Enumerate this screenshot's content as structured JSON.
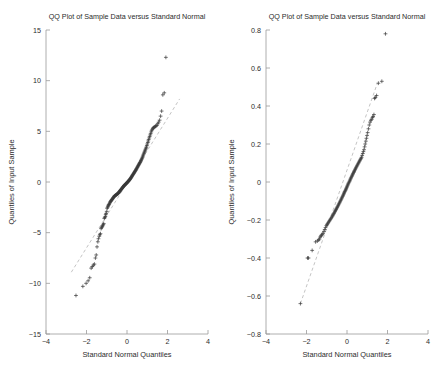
{
  "figure": {
    "width": 440,
    "height": 379,
    "background": "#ffffff",
    "marker_color": "#3a3a3a",
    "axis_color": "#9a9a9a",
    "refline_color": "#b9b9b9",
    "marker_symbol": "+"
  },
  "chart_data": [
    {
      "type": "scatter",
      "panel": "left",
      "title": "QQ Plot of Sample Data versus Standard Normal",
      "xlabel": "Standard Normal Quantiles",
      "ylabel": "Quantiles of Input Sample",
      "xlim": [
        -4,
        4
      ],
      "ylim": [
        -15,
        15
      ],
      "xticks": [
        -4,
        -2,
        0,
        2,
        4
      ],
      "xticklabels": [
        "-4",
        "-2",
        "0",
        "2",
        "4"
      ],
      "yticks": [
        15,
        10,
        5,
        0,
        -5,
        -10,
        -15
      ],
      "yticklabels": [
        "15",
        "10",
        "5",
        "0",
        "-5",
        "-10",
        "-15"
      ],
      "grid": false,
      "legend": "none",
      "reference_line": {
        "x": [
          -2.75,
          2.6
        ],
        "y": [
          -8.9,
          8.2
        ],
        "style": "dashed"
      },
      "x": [
        -2.52,
        -2.18,
        -2.02,
        -1.92,
        -1.84,
        -1.77,
        -1.71,
        -1.66,
        -1.61,
        -1.56,
        -1.52,
        -1.48,
        -1.44,
        -1.41,
        -1.37,
        -1.34,
        -1.31,
        -1.28,
        -1.25,
        -1.22,
        -1.2,
        -1.17,
        -1.15,
        -1.12,
        -1.1,
        -1.07,
        -1.05,
        -1.03,
        -1.0,
        -0.98,
        -0.96,
        -0.94,
        -0.92,
        -0.9,
        -0.88,
        -0.86,
        -0.84,
        -0.82,
        -0.8,
        -0.78,
        -0.77,
        -0.75,
        -0.73,
        -0.71,
        -0.69,
        -0.68,
        -0.66,
        -0.64,
        -0.62,
        -0.61,
        -0.59,
        -0.57,
        -0.56,
        -0.54,
        -0.52,
        -0.51,
        -0.49,
        -0.47,
        -0.46,
        -0.44,
        -0.43,
        -0.41,
        -0.39,
        -0.38,
        -0.36,
        -0.35,
        -0.33,
        -0.32,
        -0.3,
        -0.28,
        -0.27,
        -0.25,
        -0.24,
        -0.22,
        -0.21,
        -0.19,
        -0.18,
        -0.16,
        -0.15,
        -0.13,
        -0.12,
        -0.1,
        -0.09,
        -0.07,
        -0.06,
        -0.04,
        -0.03,
        -0.01,
        0.0,
        0.01,
        0.03,
        0.04,
        0.06,
        0.07,
        0.09,
        0.1,
        0.12,
        0.13,
        0.15,
        0.16,
        0.18,
        0.19,
        0.21,
        0.22,
        0.24,
        0.25,
        0.27,
        0.28,
        0.3,
        0.32,
        0.33,
        0.35,
        0.36,
        0.38,
        0.39,
        0.41,
        0.43,
        0.44,
        0.46,
        0.47,
        0.49,
        0.51,
        0.52,
        0.54,
        0.56,
        0.57,
        0.59,
        0.61,
        0.62,
        0.64,
        0.66,
        0.68,
        0.69,
        0.71,
        0.73,
        0.75,
        0.77,
        0.78,
        0.8,
        0.82,
        0.84,
        0.86,
        0.88,
        0.9,
        0.92,
        0.94,
        0.96,
        0.98,
        1.0,
        1.03,
        1.05,
        1.07,
        1.1,
        1.12,
        1.15,
        1.17,
        1.2,
        1.22,
        1.25,
        1.28,
        1.31,
        1.34,
        1.37,
        1.41,
        1.44,
        1.48,
        1.52,
        1.56,
        1.61,
        1.66,
        1.71,
        1.77,
        1.84,
        1.92,
        2.02,
        2.18,
        2.52
      ],
      "y": [
        -11.2,
        -10.3,
        -10.0,
        -9.75,
        -9.45,
        -8.5,
        -8.35,
        -8.2,
        -8.1,
        -7.5,
        -7.2,
        -6.4,
        -5.9,
        -5.6,
        -5.35,
        -5.2,
        -5.1,
        -4.6,
        -4.5,
        -4.4,
        -4.3,
        -4.2,
        -4.1,
        -3.6,
        -3.5,
        -3.4,
        -3.2,
        -3.1,
        -2.9,
        -2.6,
        -2.5,
        -2.4,
        -2.3,
        -2.25,
        -2.2,
        -2.1,
        -2.0,
        -1.95,
        -1.9,
        -1.85,
        -1.8,
        -1.75,
        -1.7,
        -1.65,
        -1.6,
        -1.55,
        -1.5,
        -1.45,
        -1.4,
        -1.38,
        -1.35,
        -1.32,
        -1.3,
        -1.27,
        -1.25,
        -1.22,
        -1.2,
        -1.17,
        -1.15,
        -1.12,
        -1.1,
        -1.05,
        -1.0,
        -0.96,
        -0.92,
        -0.88,
        -0.84,
        -0.8,
        -0.76,
        -0.72,
        -0.68,
        -0.64,
        -0.6,
        -0.56,
        -0.52,
        -0.48,
        -0.44,
        -0.4,
        -0.37,
        -0.34,
        -0.31,
        -0.28,
        -0.25,
        -0.22,
        -0.19,
        -0.16,
        -0.13,
        -0.1,
        -0.07,
        -0.04,
        -0.01,
        0.02,
        0.05,
        0.09,
        0.12,
        0.16,
        0.2,
        0.24,
        0.28,
        0.32,
        0.36,
        0.4,
        0.45,
        0.5,
        0.55,
        0.6,
        0.65,
        0.7,
        0.75,
        0.8,
        0.85,
        0.9,
        0.95,
        1.0,
        1.05,
        1.1,
        1.15,
        1.2,
        1.26,
        1.32,
        1.38,
        1.44,
        1.5,
        1.56,
        1.62,
        1.68,
        1.74,
        1.8,
        1.86,
        1.92,
        1.98,
        2.05,
        2.12,
        2.2,
        2.28,
        2.36,
        2.45,
        2.55,
        2.65,
        2.75,
        2.85,
        2.95,
        3.05,
        3.15,
        3.25,
        3.35,
        3.45,
        3.6,
        3.75,
        3.9,
        4.05,
        4.2,
        4.35,
        4.5,
        4.65,
        4.8,
        4.95,
        5.1,
        5.2,
        5.3,
        5.35,
        5.4,
        5.45,
        5.5,
        5.55,
        5.6,
        5.75,
        5.9,
        6.1,
        6.5,
        7.0,
        8.6,
        8.8,
        12.3
      ]
    },
    {
      "type": "scatter",
      "panel": "right",
      "title": "QQ Plot of Sample Data versus Standard Normal",
      "xlabel": "Standard Normal Quantiles",
      "ylabel": "Quantiles of Input Sample",
      "xlim": [
        -4,
        4
      ],
      "ylim": [
        -0.8,
        0.8
      ],
      "xticks": [
        -4,
        -2,
        0,
        2,
        4
      ],
      "xticklabels": [
        "-4",
        "-2",
        "0",
        "2",
        "4"
      ],
      "yticks": [
        0.8,
        0.6,
        0.4,
        0.2,
        0,
        -0.2,
        -0.4,
        -0.6,
        -0.8
      ],
      "yticklabels": [
        "0.8",
        "0.6",
        "0.4",
        "0.2",
        "0",
        "-0.2",
        "-0.4",
        "-0.6",
        "-0.8"
      ],
      "grid": false,
      "legend": "none",
      "reference_line": {
        "x": [
          -2.3,
          1.5
        ],
        "y": [
          -0.64,
          0.52
        ],
        "style": "dashed"
      },
      "x": [
        -2.3,
        -1.95,
        -1.9,
        -1.72,
        -1.55,
        -1.46,
        -1.4,
        -1.36,
        -1.33,
        -1.29,
        -1.26,
        -1.22,
        -1.18,
        -1.14,
        -1.1,
        -1.06,
        -1.02,
        -0.99,
        -0.96,
        -0.93,
        -0.9,
        -0.87,
        -0.84,
        -0.81,
        -0.78,
        -0.75,
        -0.72,
        -0.7,
        -0.67,
        -0.64,
        -0.62,
        -0.59,
        -0.57,
        -0.54,
        -0.52,
        -0.49,
        -0.47,
        -0.44,
        -0.42,
        -0.4,
        -0.37,
        -0.35,
        -0.33,
        -0.3,
        -0.28,
        -0.26,
        -0.24,
        -0.21,
        -0.19,
        -0.17,
        -0.15,
        -0.13,
        -0.11,
        -0.08,
        -0.06,
        -0.04,
        -0.02,
        0.0,
        0.02,
        0.04,
        0.06,
        0.08,
        0.11,
        0.13,
        0.15,
        0.17,
        0.19,
        0.21,
        0.24,
        0.26,
        0.28,
        0.3,
        0.33,
        0.35,
        0.37,
        0.4,
        0.42,
        0.44,
        0.47,
        0.49,
        0.52,
        0.54,
        0.57,
        0.59,
        0.62,
        0.64,
        0.67,
        0.7,
        0.72,
        0.75,
        0.78,
        0.81,
        0.84,
        0.87,
        0.9,
        0.93,
        0.96,
        0.99,
        1.02,
        1.06,
        1.1,
        1.14,
        1.18,
        1.22,
        1.26,
        1.29,
        1.33,
        1.36,
        1.4,
        1.46,
        1.55,
        1.72,
        1.9,
        1.95,
        2.1
      ],
      "y": [
        -0.64,
        -0.4,
        -0.4,
        -0.36,
        -0.315,
        -0.31,
        -0.305,
        -0.3,
        -0.29,
        -0.285,
        -0.28,
        -0.275,
        -0.27,
        -0.26,
        -0.25,
        -0.24,
        -0.23,
        -0.225,
        -0.22,
        -0.215,
        -0.21,
        -0.205,
        -0.2,
        -0.195,
        -0.19,
        -0.185,
        -0.18,
        -0.175,
        -0.17,
        -0.165,
        -0.16,
        -0.155,
        -0.15,
        -0.145,
        -0.14,
        -0.135,
        -0.13,
        -0.125,
        -0.12,
        -0.115,
        -0.11,
        -0.105,
        -0.1,
        -0.095,
        -0.09,
        -0.085,
        -0.08,
        -0.075,
        -0.07,
        -0.065,
        -0.06,
        -0.055,
        -0.05,
        -0.045,
        -0.04,
        -0.035,
        -0.03,
        -0.025,
        -0.02,
        -0.015,
        -0.01,
        -0.005,
        0.0,
        0.005,
        0.01,
        0.015,
        0.02,
        0.025,
        0.03,
        0.035,
        0.04,
        0.045,
        0.05,
        0.055,
        0.06,
        0.065,
        0.07,
        0.075,
        0.08,
        0.085,
        0.09,
        0.095,
        0.1,
        0.105,
        0.11,
        0.115,
        0.12,
        0.125,
        0.13,
        0.14,
        0.15,
        0.16,
        0.17,
        0.185,
        0.2,
        0.215,
        0.23,
        0.245,
        0.26,
        0.28,
        0.3,
        0.315,
        0.325,
        0.33,
        0.34,
        0.345,
        0.355,
        0.44,
        0.445,
        0.455,
        0.52,
        0.53,
        0.78
      ]
    }
  ]
}
